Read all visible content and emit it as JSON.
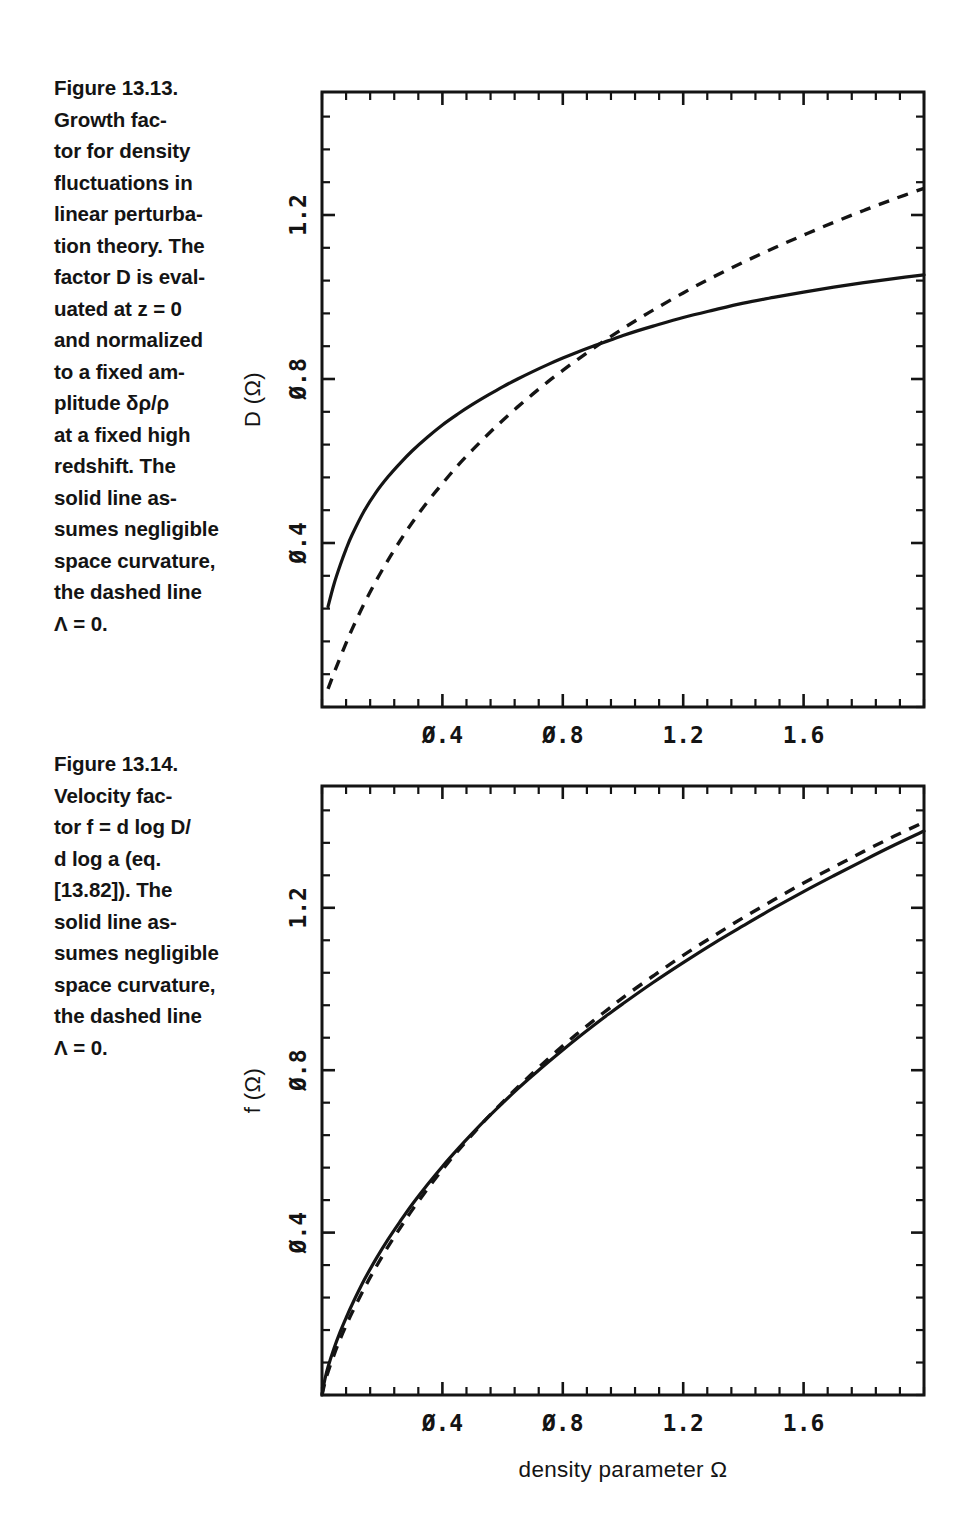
{
  "page": {
    "background": "#ffffff",
    "ink": "#141414"
  },
  "figures": [
    {
      "id": "figure-13-13",
      "caption": {
        "number": "Figure 13.13.",
        "text": "Figure 13.13.\nGrowth fac-\ntor for density\nfluctuations in\nlinear perturba-\ntion theory. The\nfactor D is eval-\nuated at z = 0\nand normalized\nto a fixed am-\nplitude δρ/ρ\nat a fixed high\nredshift. The\nsolid line as-\nsumes negligible\nspace curvature,\nthe dashed line\nΛ = 0."
      },
      "chart_data": {
        "type": "line",
        "title": "",
        "xlabel": "density  parameter Ω",
        "ylabel": "D (Ω)",
        "xlim": [
          0.0,
          2.0
        ],
        "ylim": [
          0.0,
          1.5
        ],
        "xticks": [
          0.4,
          0.8,
          1.2,
          1.6
        ],
        "xticklabels": [
          "0.4",
          "0.8",
          "1.2",
          "1.6"
        ],
        "yticks": [
          0.4,
          0.8,
          1.2
        ],
        "yticklabels": [
          "0.4",
          "0.8",
          "1.2"
        ],
        "minor_ticks_per_major": 4,
        "grid": false,
        "legend": "none",
        "series": [
          {
            "name": "solid line — negligible space curvature (flat, Lambda)",
            "style": "solid",
            "x": [
              0.02,
              0.04,
              0.06,
              0.08,
              0.1,
              0.14,
              0.18,
              0.22,
              0.26,
              0.3,
              0.35,
              0.4,
              0.45,
              0.5,
              0.55,
              0.6,
              0.65,
              0.7,
              0.75,
              0.8,
              0.85,
              0.9,
              0.95,
              1.0,
              1.05,
              1.1,
              1.2,
              1.3,
              1.4,
              1.5,
              1.6,
              1.7,
              1.8,
              1.9,
              2.0
            ],
            "y": [
              0.245,
              0.3,
              0.345,
              0.385,
              0.42,
              0.478,
              0.524,
              0.562,
              0.595,
              0.625,
              0.658,
              0.688,
              0.714,
              0.738,
              0.76,
              0.781,
              0.8,
              0.818,
              0.835,
              0.851,
              0.866,
              0.88,
              0.893,
              0.906,
              0.918,
              0.929,
              0.95,
              0.968,
              0.985,
              0.999,
              1.012,
              1.024,
              1.035,
              1.045,
              1.054
            ]
          },
          {
            "name": "dashed line — Lambda = 0 (open)",
            "style": "dashed",
            "x": [
              0.02,
              0.04,
              0.06,
              0.08,
              0.1,
              0.14,
              0.18,
              0.22,
              0.26,
              0.3,
              0.35,
              0.4,
              0.45,
              0.5,
              0.55,
              0.6,
              0.65,
              0.7,
              0.75,
              0.8,
              0.85,
              0.9,
              0.95,
              1.0,
              1.05,
              1.1,
              1.2,
              1.3,
              1.4,
              1.5,
              1.6,
              1.7,
              1.8,
              1.9,
              2.0
            ],
            "y": [
              0.044,
              0.083,
              0.12,
              0.156,
              0.19,
              0.252,
              0.308,
              0.359,
              0.406,
              0.45,
              0.5,
              0.545,
              0.588,
              0.627,
              0.664,
              0.699,
              0.732,
              0.763,
              0.793,
              0.821,
              0.848,
              0.874,
              0.899,
              0.923,
              0.946,
              0.968,
              1.01,
              1.049,
              1.085,
              1.119,
              1.151,
              1.182,
              1.211,
              1.239,
              1.265
            ]
          }
        ],
        "annotations": [
          "curves cross near Ω = 1.0, D = 0.92"
        ]
      }
    },
    {
      "id": "figure-13-14",
      "caption": {
        "number": "Figure 13.14.",
        "text": "Figure 13.14.\nVelocity fac-\ntor f = d log D/\nd log a  (eq.\n[13.82]). The\nsolid line as-\nsumes negligible\nspace curvature,\nthe dashed line\nΛ = 0."
      },
      "chart_data": {
        "type": "line",
        "title": "",
        "xlabel": "density  parameter Ω",
        "ylabel": "f (Ω)",
        "xlim": [
          0.0,
          2.0
        ],
        "ylim": [
          0.0,
          1.5
        ],
        "xticks": [
          0.4,
          0.8,
          1.2,
          1.6
        ],
        "xticklabels": [
          "0.4",
          "0.8",
          "1.2",
          "1.6"
        ],
        "yticks": [
          0.4,
          0.8,
          1.2
        ],
        "yticklabels": [
          "0.4",
          "0.8",
          "1.2"
        ],
        "minor_ticks_per_major": 4,
        "grid": false,
        "legend": "none",
        "series": [
          {
            "name": "solid line — negligible space curvature (flat, Lambda)",
            "style": "solid",
            "x": [
              0.0,
              0.01,
              0.02,
              0.04,
              0.06,
              0.08,
              0.1,
              0.14,
              0.18,
              0.22,
              0.26,
              0.3,
              0.35,
              0.4,
              0.45,
              0.5,
              0.55,
              0.6,
              0.65,
              0.7,
              0.75,
              0.8,
              0.85,
              0.9,
              0.95,
              1.0,
              1.1,
              1.2,
              1.3,
              1.4,
              1.5,
              1.6,
              1.7,
              1.8,
              1.9,
              2.0
            ],
            "y": [
              0.0,
              0.04,
              0.069,
              0.115,
              0.155,
              0.19,
              0.223,
              0.283,
              0.336,
              0.384,
              0.428,
              0.47,
              0.518,
              0.563,
              0.605,
              0.645,
              0.683,
              0.719,
              0.754,
              0.787,
              0.819,
              0.85,
              0.88,
              0.909,
              0.937,
              0.964,
              1.016,
              1.065,
              1.112,
              1.156,
              1.199,
              1.24,
              1.279,
              1.317,
              1.354,
              1.389
            ]
          },
          {
            "name": "dashed line — Lambda = 0 (open)",
            "style": "dashed",
            "x": [
              0.0,
              0.01,
              0.02,
              0.04,
              0.06,
              0.08,
              0.1,
              0.14,
              0.18,
              0.22,
              0.26,
              0.3,
              0.35,
              0.4,
              0.45,
              0.5,
              0.55,
              0.6,
              0.65,
              0.7,
              0.75,
              0.8,
              0.85,
              0.9,
              0.95,
              1.0,
              1.1,
              1.2,
              1.3,
              1.4,
              1.5,
              1.6,
              1.7,
              1.8,
              1.9,
              2.0
            ],
            "y": [
              0.0,
              0.032,
              0.057,
              0.099,
              0.137,
              0.171,
              0.203,
              0.262,
              0.316,
              0.366,
              0.412,
              0.456,
              0.507,
              0.555,
              0.6,
              0.642,
              0.683,
              0.721,
              0.758,
              0.793,
              0.827,
              0.86,
              0.891,
              0.921,
              0.95,
              0.979,
              1.032,
              1.083,
              1.13,
              1.176,
              1.219,
              1.261,
              1.3,
              1.339,
              1.376,
              1.411
            ]
          }
        ],
        "annotations": [
          "the two curves nearly coincide; dashed lies marginally above for Ω > 1"
        ]
      }
    }
  ]
}
